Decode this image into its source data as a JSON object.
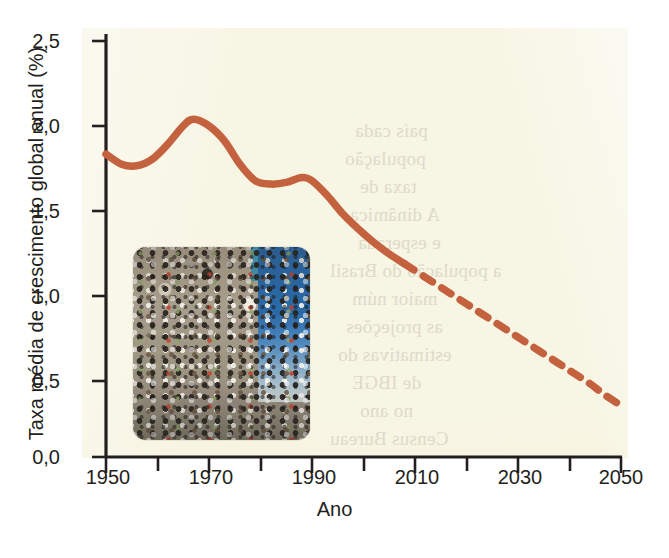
{
  "figure": {
    "background_color": "#f7f5e3",
    "line_color": "#c4613e",
    "text_color": "#231f20"
  },
  "chart_data": {
    "type": "line",
    "title": "",
    "xlabel": "Ano",
    "ylabel": "Taxa média de crescimento global anual (%)",
    "xlim": [
      1950,
      2050
    ],
    "ylim": [
      0.0,
      2.5
    ],
    "xticks": [
      1950,
      1970,
      1990,
      2010,
      2030,
      2050
    ],
    "xtick_labels": [
      "1950",
      "1970",
      "1990",
      "2010",
      "2030",
      "2050"
    ],
    "xminor_step": 10,
    "yticks": [
      0.0,
      0.5,
      1.0,
      1.5,
      2.0,
      2.5
    ],
    "ytick_labels": [
      "0,0",
      "0,5",
      "1,0",
      "1,5",
      "2,0",
      "2,5"
    ],
    "grid": false,
    "legend": null,
    "decimal_separator": ",",
    "series": [
      {
        "name": "Taxa média de crescimento global anual",
        "style": "solid",
        "color": "#c4613e",
        "segment": "observado",
        "x": [
          1950,
          1953,
          1956,
          1959,
          1962,
          1965,
          1967,
          1970,
          1973,
          1976,
          1979,
          1982,
          1985,
          1988,
          1990,
          1993,
          1996,
          1999,
          2002,
          2005,
          2008
        ],
        "y": [
          1.82,
          1.76,
          1.75,
          1.79,
          1.88,
          1.99,
          2.03,
          1.99,
          1.9,
          1.76,
          1.66,
          1.64,
          1.65,
          1.68,
          1.66,
          1.57,
          1.46,
          1.37,
          1.29,
          1.22,
          1.16
        ]
      },
      {
        "name": "Taxa média de crescimento global anual (projeção)",
        "style": "dashed",
        "color": "#c4613e",
        "segment": "projetado",
        "x": [
          2008,
          2012,
          2016,
          2020,
          2024,
          2028,
          2032,
          2036,
          2040,
          2044,
          2047,
          2050
        ],
        "y": [
          1.16,
          1.08,
          1.0,
          0.92,
          0.84,
          0.76,
          0.68,
          0.6,
          0.52,
          0.44,
          0.37,
          0.31
        ]
      }
    ],
    "annotations": [
      {
        "name": "inset-photo",
        "kind": "image",
        "description": "Fotografia de uma multidão de pessoas em uma rua movimentada"
      }
    ]
  },
  "bleed_text": [
    "país cada",
    "população",
    "taxa de",
    "A dinâmica",
    "e esperada",
    "a população do Brasil",
    "maior núm",
    "as projeções",
    "estimativas do",
    "de IBGE",
    "no ano",
    "Census Bureau"
  ]
}
